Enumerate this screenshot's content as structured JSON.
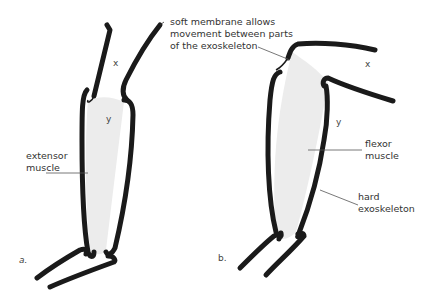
{
  "figure": {
    "panels": [
      {
        "id": "a",
        "caption": "a.",
        "state": "extended",
        "segment_upper_label": "x",
        "segment_lower_label": "y"
      },
      {
        "id": "b",
        "caption": "b.",
        "state": "flexed",
        "segment_upper_label": "x",
        "segment_lower_label": "y"
      }
    ]
  },
  "labels": {
    "membrane": [
      "soft membrane allows",
      "movement between parts",
      "of the exoskeleton"
    ],
    "extensor": [
      "extensor",
      "muscle"
    ],
    "flexor": [
      "flexor",
      "muscle"
    ],
    "exoskeleton": [
      "hard",
      "exoskeleton"
    ]
  },
  "colors": {
    "exoskeleton": "#1a1a1a",
    "muscle": "#ececec",
    "leader": "#555555",
    "text": "#333333"
  }
}
